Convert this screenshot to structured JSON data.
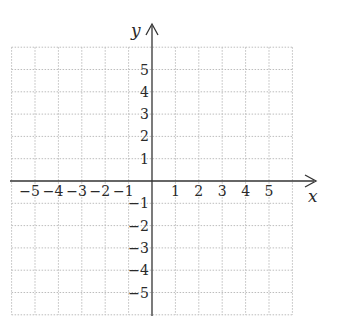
{
  "diagram": {
    "type": "coordinate-plane",
    "x_axis_label": "x",
    "y_axis_label": "y",
    "x_range": [
      -6,
      6
    ],
    "y_range": [
      -6,
      6
    ],
    "grid": "dotted",
    "colors": {
      "axis": "#333333",
      "grid": "#bdbdbd",
      "text": "#2a2a2a",
      "background": "#ffffff"
    },
    "x_tick_labels": [
      {
        "value": -5,
        "text": "−5"
      },
      {
        "value": -4,
        "text": "−4"
      },
      {
        "value": -3,
        "text": "−3"
      },
      {
        "value": -2,
        "text": "−2"
      },
      {
        "value": -1,
        "text": "−1"
      },
      {
        "value": 1,
        "text": "1"
      },
      {
        "value": 2,
        "text": "2"
      },
      {
        "value": 3,
        "text": "3"
      },
      {
        "value": 4,
        "text": "4"
      },
      {
        "value": 5,
        "text": "5"
      }
    ],
    "y_tick_labels": [
      {
        "value": 5,
        "text": "5"
      },
      {
        "value": 4,
        "text": "4"
      },
      {
        "value": 3,
        "text": "3"
      },
      {
        "value": 2,
        "text": "2"
      },
      {
        "value": 1,
        "text": "1"
      },
      {
        "value": -1,
        "text": "−1"
      },
      {
        "value": -2,
        "text": "−2"
      },
      {
        "value": -3,
        "text": "−3"
      },
      {
        "value": -4,
        "text": "−4"
      },
      {
        "value": -5,
        "text": "−5"
      }
    ]
  }
}
